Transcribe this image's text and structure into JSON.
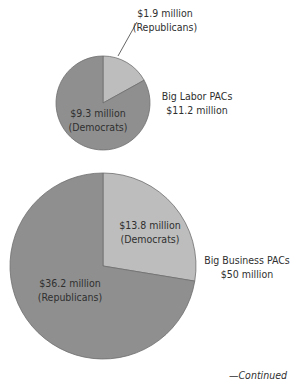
{
  "chart_data": [
    {
      "type": "pie",
      "title": "Big Labor PACs",
      "total_label": "$11.2 million",
      "total": 11.2,
      "slices": [
        {
          "name": "Republicans",
          "value": 1.9,
          "label_line1": "$1.9 million",
          "label_line2": "(Republicans)",
          "color": "#bdbdbd"
        },
        {
          "name": "Democrats",
          "value": 9.3,
          "label_line1": "$9.3 million",
          "label_line2": "(Democrats)",
          "color": "#8f8f8f"
        }
      ]
    },
    {
      "type": "pie",
      "title": "Big Business PACs",
      "total_label": "$50 million",
      "total": 50,
      "slices": [
        {
          "name": "Democrats",
          "value": 13.8,
          "label_line1": "$13.8 million",
          "label_line2": "(Democrats)",
          "color": "#bdbdbd"
        },
        {
          "name": "Republicans",
          "value": 36.2,
          "label_line1": "$36.2 million",
          "label_line2": "(Republicans)",
          "color": "#8f8f8f"
        }
      ]
    }
  ],
  "footer": {
    "continued": "—Continued"
  }
}
